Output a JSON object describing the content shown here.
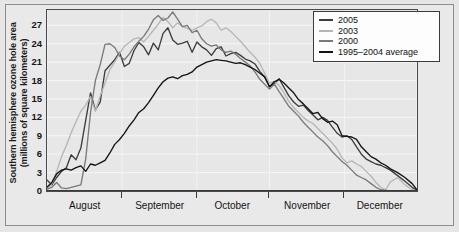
{
  "chart_data": {
    "type": "line",
    "title": "",
    "xlabel": "",
    "ylabel": "Southern hemisphere ozone hole area (millions of square kilometers)",
    "ylabel_line1": "Southern hemisphere ozone hole area",
    "ylabel_line2": "(millions of square kilometers)",
    "ylim": [
      0,
      29.5
    ],
    "yticks": [
      0,
      3,
      6,
      9,
      12,
      15,
      18,
      21,
      24,
      27
    ],
    "xlim": [
      0,
      153
    ],
    "xtick_labels": [
      "August",
      "September",
      "October",
      "November",
      "December"
    ],
    "xtick_positions": [
      16,
      47,
      77,
      108,
      138
    ],
    "xgrid_positions": [
      0,
      31,
      62,
      92,
      123,
      153
    ],
    "grid": "horizontal",
    "legend_position": "top-right",
    "series": [
      {
        "name": "2005",
        "color": "#3d3d3d",
        "x": [
          0,
          2,
          4,
          6,
          8,
          10,
          12,
          14,
          16,
          18,
          20,
          22,
          24,
          26,
          28,
          30,
          32,
          34,
          36,
          38,
          40,
          42,
          44,
          46,
          48,
          50,
          52,
          54,
          56,
          58,
          60,
          62,
          64,
          66,
          68,
          70,
          72,
          74,
          76,
          78,
          80,
          82,
          84,
          86,
          88,
          90,
          92,
          94,
          96,
          98,
          100,
          102,
          104,
          106,
          108,
          110,
          112,
          114,
          116,
          118,
          120,
          122,
          124,
          126,
          128,
          130,
          132,
          134,
          136,
          138,
          140,
          142,
          145,
          148,
          151,
          153
        ],
        "values": [
          1.8,
          1.0,
          2.2,
          3.2,
          3.8,
          5.9,
          5.1,
          7.0,
          11.5,
          16.0,
          13.2,
          14.5,
          19.6,
          20.5,
          21.4,
          22.6,
          20.3,
          20.8,
          22.9,
          24.2,
          23.5,
          22.2,
          24.1,
          23.0,
          25.7,
          26.6,
          24.6,
          23.9,
          24.1,
          24.4,
          22.6,
          24.3,
          23.5,
          23.0,
          22.1,
          23.2,
          23.5,
          22.0,
          22.4,
          22.6,
          22.1,
          21.5,
          21.2,
          20.7,
          19.5,
          18.6,
          17.0,
          17.5,
          18.3,
          16.9,
          15.5,
          14.5,
          13.8,
          14.0,
          13.1,
          12.4,
          11.6,
          12.0,
          11.5,
          10.4,
          9.4,
          8.8,
          9.0,
          8.4,
          7.2,
          6.0,
          5.2,
          4.8,
          4.4,
          4.2,
          3.8,
          3.4,
          2.5,
          1.6,
          0.6,
          0.1
        ]
      },
      {
        "name": "2003",
        "color": "#b6b6b6",
        "x": [
          0,
          2,
          4,
          6,
          8,
          10,
          12,
          14,
          16,
          18,
          20,
          22,
          24,
          26,
          28,
          30,
          32,
          34,
          36,
          38,
          40,
          42,
          44,
          46,
          48,
          50,
          52,
          54,
          56,
          58,
          60,
          62,
          64,
          66,
          68,
          70,
          72,
          74,
          76,
          78,
          80,
          82,
          84,
          86,
          88,
          90,
          92,
          94,
          96,
          98,
          100,
          102,
          104,
          106,
          108,
          110,
          112,
          114,
          116,
          118,
          120,
          122,
          124,
          126,
          128,
          130,
          132,
          134,
          136,
          138,
          140,
          142,
          145,
          148,
          151,
          153
        ],
        "values": [
          0.2,
          1.2,
          3.2,
          5.6,
          7.4,
          9.5,
          11.3,
          13.0,
          14.0,
          15.4,
          13.0,
          15.5,
          17.6,
          19.8,
          21.0,
          22.4,
          23.6,
          24.2,
          24.8,
          25.0,
          24.3,
          25.2,
          26.2,
          27.2,
          28.3,
          27.6,
          26.6,
          27.4,
          26.8,
          26.5,
          26.2,
          26.6,
          26.9,
          27.6,
          28.0,
          27.4,
          26.2,
          26.6,
          26.0,
          25.2,
          24.4,
          23.5,
          22.6,
          21.8,
          20.8,
          19.2,
          17.6,
          17.9,
          17.2,
          16.0,
          14.6,
          13.6,
          12.8,
          12.0,
          11.4,
          11.0,
          10.2,
          9.4,
          8.6,
          7.8,
          6.8,
          5.4,
          4.6,
          4.9,
          4.4,
          4.0,
          3.2,
          2.4,
          1.4,
          0.6,
          0.2,
          1.5,
          2.2,
          1.0,
          0.2,
          0.0
        ]
      },
      {
        "name": "2000",
        "color": "#7a7a7a",
        "x": [
          0,
          2,
          4,
          6,
          8,
          10,
          12,
          14,
          16,
          18,
          20,
          22,
          24,
          26,
          28,
          30,
          32,
          34,
          36,
          38,
          40,
          42,
          44,
          46,
          48,
          50,
          52,
          54,
          56,
          58,
          60,
          62,
          64,
          66,
          68,
          70,
          72,
          74,
          76,
          78,
          80,
          82,
          84,
          86,
          88,
          90,
          92,
          94,
          96,
          98,
          100,
          102,
          104,
          106,
          108,
          110,
          112,
          114,
          116,
          118,
          120,
          122,
          124,
          126,
          128,
          130,
          132,
          134,
          136,
          138,
          140,
          142,
          145,
          148,
          151,
          153
        ],
        "values": [
          0.3,
          0.6,
          1.4,
          0.5,
          0.4,
          0.6,
          0.8,
          1.0,
          5.2,
          12.8,
          18.0,
          20.6,
          23.9,
          24.0,
          23.4,
          22.0,
          21.4,
          22.3,
          23.5,
          24.4,
          25.2,
          26.4,
          27.9,
          28.6,
          27.8,
          28.2,
          29.2,
          28.0,
          26.8,
          27.0,
          25.8,
          26.2,
          24.8,
          24.0,
          23.6,
          23.8,
          23.0,
          22.6,
          22.8,
          22.3,
          21.6,
          21.0,
          20.4,
          19.4,
          18.2,
          17.4,
          16.6,
          17.4,
          16.2,
          15.0,
          13.8,
          13.0,
          12.2,
          11.2,
          10.4,
          9.6,
          8.8,
          8.2,
          7.4,
          6.4,
          5.6,
          4.8,
          4.2,
          3.4,
          2.6,
          2.2,
          1.8,
          1.2,
          0.6,
          0.2,
          0.1,
          0.0,
          0.0,
          0.0,
          0.0,
          0.0
        ]
      },
      {
        "name": "1995–2004 average",
        "color": "#141414",
        "x": [
          0,
          2,
          4,
          6,
          8,
          10,
          12,
          14,
          16,
          18,
          20,
          22,
          24,
          26,
          28,
          30,
          32,
          34,
          36,
          38,
          40,
          42,
          44,
          46,
          48,
          50,
          52,
          54,
          56,
          58,
          60,
          62,
          64,
          66,
          68,
          70,
          72,
          74,
          76,
          78,
          80,
          82,
          84,
          86,
          88,
          90,
          92,
          94,
          96,
          98,
          100,
          102,
          104,
          106,
          108,
          110,
          112,
          114,
          116,
          118,
          120,
          122,
          124,
          126,
          128,
          130,
          132,
          134,
          136,
          138,
          140,
          142,
          145,
          148,
          151,
          153
        ],
        "values": [
          0.6,
          1.4,
          2.8,
          3.4,
          3.6,
          3.4,
          3.8,
          4.1,
          3.2,
          4.4,
          4.2,
          4.6,
          5.0,
          6.2,
          7.6,
          8.4,
          9.4,
          10.6,
          11.6,
          12.8,
          13.4,
          14.4,
          15.6,
          16.8,
          17.8,
          18.4,
          18.6,
          18.3,
          18.8,
          19.0,
          19.4,
          20.2,
          20.6,
          21.0,
          21.2,
          21.4,
          21.3,
          21.2,
          21.0,
          20.8,
          20.9,
          20.6,
          20.2,
          19.8,
          19.2,
          18.6,
          17.0,
          17.8,
          18.2,
          17.6,
          16.8,
          16.0,
          14.9,
          14.2,
          13.4,
          12.6,
          12.8,
          11.8,
          11.2,
          11.4,
          10.8,
          9.0,
          8.9,
          8.8,
          8.4,
          7.2,
          6.4,
          5.6,
          5.2,
          4.6,
          4.2,
          3.6,
          3.0,
          2.2,
          1.2,
          0.2
        ]
      }
    ]
  },
  "legend": {
    "items": [
      {
        "label": "2005",
        "color": "#3d3d3d"
      },
      {
        "label": "2003",
        "color": "#b6b6b6"
      },
      {
        "label": "2000",
        "color": "#7a7a7a"
      },
      {
        "label": "1995–2004 average",
        "color": "#141414"
      }
    ]
  },
  "colors": {
    "plot_background": "#e7e7e7",
    "page_background": "#e6e6e6",
    "gridline": "#f7f7f7",
    "axis": "#4a4a4a",
    "text": "#141414"
  }
}
